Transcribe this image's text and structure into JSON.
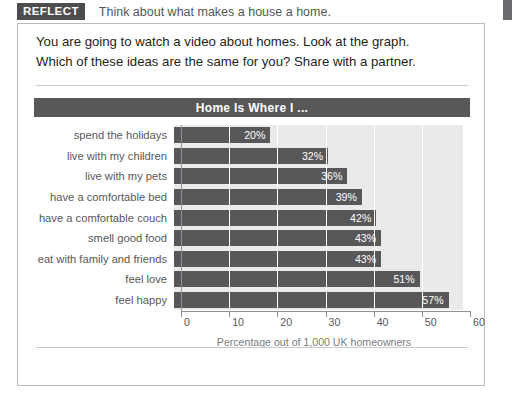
{
  "header": {
    "tag": "REFLECT",
    "prompt": "Think about what makes a house a home.",
    "edge_tab_icon": "page-edge-tab"
  },
  "intro": {
    "line1": "You are going to watch a video about homes. Look at the graph.",
    "line2": "Which of these ideas are the same for you? Share with a partner."
  },
  "colors": {
    "bar": "#58585a",
    "track": "#e9eaea",
    "title_bar": "#58585a",
    "text": "#58585a",
    "panel_border": "#b9bbbd"
  },
  "chart_data": {
    "type": "bar",
    "orientation": "horizontal",
    "title": "Home Is Where I ...",
    "xlabel": "Percentage out of 1,000 UK homeowners",
    "ylabel": "",
    "xlim": [
      0,
      60
    ],
    "xticks": [
      0,
      10,
      20,
      30,
      40,
      50,
      60
    ],
    "xtick_labels": [
      "0",
      "10",
      "20",
      "30",
      "40",
      "50",
      "60"
    ],
    "grid": true,
    "legend": false,
    "categories": [
      "spend the holidays",
      "live with my children",
      "live with my pets",
      "have a comfortable bed",
      "have a comfortable couch",
      "smell good food",
      "eat with family and friends",
      "feel love",
      "feel happy"
    ],
    "values": [
      20,
      32,
      36,
      39,
      42,
      43,
      43,
      51,
      57
    ],
    "value_labels": [
      "20%",
      "32%",
      "36%",
      "39%",
      "42%",
      "43%",
      "43%",
      "51%",
      "57%"
    ]
  }
}
